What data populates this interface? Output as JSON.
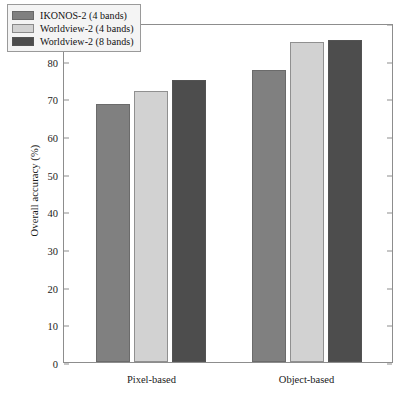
{
  "chart_data": {
    "type": "bar",
    "title": "",
    "xlabel": "",
    "ylabel": "Overall accuracy (%)",
    "categories": [
      "Pixel-based",
      "Object-based"
    ],
    "series": [
      {
        "name": "IKONOS-2 (4 bands)",
        "values": [
          68.5,
          77.5
        ],
        "color": "#808080"
      },
      {
        "name": "Worldview-2 (4 bands)",
        "values": [
          72.0,
          85.0
        ],
        "color": "#d2d2d2"
      },
      {
        "name": "Worldview-2 (8 bands)",
        "values": [
          75.0,
          85.5
        ],
        "color": "#4d4d4d"
      }
    ],
    "ylim": [
      0,
      90
    ],
    "yticks": [
      0,
      10,
      20,
      30,
      40,
      50,
      60,
      70,
      80,
      90
    ],
    "ytick_labels": [
      "0",
      "10",
      "20",
      "30",
      "40",
      "50",
      "60",
      "70",
      "80",
      "90"
    ],
    "grid": false,
    "legend_position": "upper left"
  },
  "legend": {
    "entries": [
      {
        "label": "IKONOS-2 (4 bands)"
      },
      {
        "label": "Worldview-2 (4 bands)"
      },
      {
        "label": "Worldview-2 (8 bands)"
      }
    ]
  }
}
